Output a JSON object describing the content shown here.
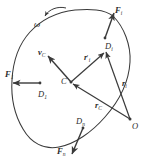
{
  "figure": {
    "canvas": {
      "width": 149,
      "height": 162
    },
    "colors": {
      "stroke": "#3a3a3a",
      "label": "#2b2b2b",
      "background": "#ffffff"
    },
    "labels": {
      "omega": "ω",
      "force_1": "F",
      "force_1_sub": "1",
      "force_i": "F",
      "force_i_sub": "i",
      "force_n": "F",
      "force_n_sub": "n",
      "point_d1": "D",
      "point_d1_sub": "1",
      "point_di": "D",
      "point_di_sub": "i",
      "point_dn": "D",
      "point_dn_sub": "n",
      "velocity_c": "v",
      "velocity_c_sub": "C",
      "radius_prime_i": "r",
      "radius_prime_i_mark": "′",
      "radius_prime_i_sub": "i",
      "radius_c": "r",
      "radius_c_sub": "C",
      "radius_i": "r",
      "radius_i_sub": "i",
      "point_c": "C",
      "point_o": "O"
    },
    "points": {
      "C": {
        "x": 71,
        "y": 82
      },
      "O": {
        "x": 130,
        "y": 119
      },
      "D1": {
        "x": 22,
        "y": 83
      },
      "Di": {
        "x": 111,
        "y": 15
      },
      "Dn": {
        "x": 80,
        "y": 141
      }
    },
    "vectors": [
      {
        "name": "F1",
        "from": "D1",
        "direction": "left",
        "label": "F₁"
      },
      {
        "name": "Fi",
        "from": "Di",
        "direction": "up-right",
        "label": "Fᵢ"
      },
      {
        "name": "Fn",
        "from": "Dn",
        "direction": "down-left",
        "label": "Fₙ"
      },
      {
        "name": "vC",
        "from": "C",
        "direction": "up-left",
        "label": "v_C"
      },
      {
        "name": "r_prime_i",
        "from": "C",
        "to": "Di",
        "label": "r′ᵢ"
      },
      {
        "name": "r_C",
        "from": "O",
        "to": "C",
        "label": "r_C"
      },
      {
        "name": "r_i",
        "from": "O",
        "to": "Di",
        "label": "rᵢ"
      }
    ]
  }
}
